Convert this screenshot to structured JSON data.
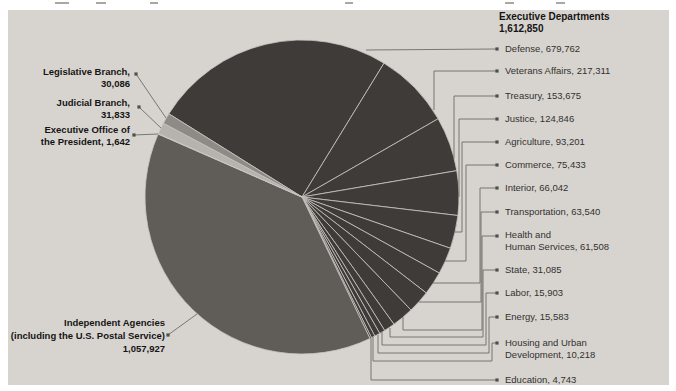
{
  "figure": {
    "background": "#ffffff",
    "panel_background": "#d7d4d0",
    "leader_line_color": "#6e6c68",
    "marker_color": "#52504c",
    "separator_color": "#c9c6c1"
  },
  "chart_data": {
    "type": "pie",
    "start_angle_deg": 302,
    "clockwise": true,
    "legend_position": "none",
    "grid": false,
    "groups": [
      {
        "id": "executive-departments",
        "label": "Executive Departments",
        "total": "1,612,850"
      },
      {
        "id": "independent-agencies",
        "label": "Independent Agencies",
        "sublabel": "(including the U.S. Postal Service)",
        "total": "1,057,927"
      }
    ],
    "slices": [
      {
        "id": "defense",
        "label": "Defense",
        "value": 679762,
        "color": "#3f3b39",
        "side": "right",
        "label_lines": [
          "Defense, 679,762"
        ]
      },
      {
        "id": "veterans",
        "label": "Veterans Affairs",
        "value": 217311,
        "color": "#3f3b39",
        "side": "right",
        "label_lines": [
          "Veterans Affairs, 217,311"
        ]
      },
      {
        "id": "treasury",
        "label": "Treasury",
        "value": 153675,
        "color": "#3f3b39",
        "side": "right",
        "label_lines": [
          "Treasury, 153,675"
        ]
      },
      {
        "id": "justice",
        "label": "Justice",
        "value": 124846,
        "color": "#3f3b39",
        "side": "right",
        "label_lines": [
          "Justice, 124,846"
        ]
      },
      {
        "id": "agriculture",
        "label": "Agriculture",
        "value": 93201,
        "color": "#3f3b39",
        "side": "right",
        "label_lines": [
          "Agriculture, 93,201"
        ]
      },
      {
        "id": "commerce",
        "label": "Commerce",
        "value": 75433,
        "color": "#3f3b39",
        "side": "right",
        "label_lines": [
          "Commerce, 75,433"
        ]
      },
      {
        "id": "interior",
        "label": "Interior",
        "value": 66042,
        "color": "#3f3b39",
        "side": "right",
        "label_lines": [
          "Interior, 66,042"
        ]
      },
      {
        "id": "transportation",
        "label": "Transportation",
        "value": 63540,
        "color": "#3f3b39",
        "side": "right",
        "label_lines": [
          "Transportation, 63,540"
        ]
      },
      {
        "id": "hhs",
        "label": "Health and Human Services",
        "value": 61508,
        "color": "#3f3b39",
        "side": "right",
        "label_lines": [
          "Health and",
          "Human Services, 61,508"
        ]
      },
      {
        "id": "state",
        "label": "State",
        "value": 31085,
        "color": "#3f3b39",
        "side": "right",
        "label_lines": [
          "State, 31,085"
        ]
      },
      {
        "id": "labor",
        "label": "Labor",
        "value": 15903,
        "color": "#3f3b39",
        "side": "right",
        "label_lines": [
          "Labor, 15,903"
        ]
      },
      {
        "id": "energy",
        "label": "Energy",
        "value": 15583,
        "color": "#3f3b39",
        "side": "right",
        "label_lines": [
          "Energy, 15,583"
        ]
      },
      {
        "id": "hud",
        "label": "Housing and Urban Development",
        "value": 10218,
        "color": "#3f3b39",
        "side": "right",
        "label_lines": [
          "Housing and Urban",
          "Development, 10,218"
        ]
      },
      {
        "id": "education",
        "label": "Education",
        "value": 4743,
        "color": "#3f3b39",
        "side": "right",
        "label_lines": [
          "Education, 4,743"
        ]
      },
      {
        "id": "independent",
        "label": "Independent Agencies",
        "value": 1057927,
        "color": "#605d59",
        "side": "left",
        "label_lines": [
          "Independent Agencies",
          "(including the U.S. Postal Service)",
          "1,057,927"
        ]
      },
      {
        "id": "execoffice",
        "label": "Executive Office of the President",
        "value": 1642,
        "color": "#eae8e4",
        "side": "left",
        "label_lines": [
          "Executive Office of",
          "the President, 1,642"
        ]
      },
      {
        "id": "judicial",
        "label": "Judicial Branch",
        "value": 31833,
        "color": "#b6b3ae",
        "side": "left",
        "label_lines": [
          "Judicial Branch,",
          "31,833"
        ]
      },
      {
        "id": "legislative",
        "label": "Legislative Branch",
        "value": 30086,
        "color": "#8e8b86",
        "side": "left",
        "label_lines": [
          "Legislative Branch,",
          "30,086"
        ]
      }
    ]
  }
}
